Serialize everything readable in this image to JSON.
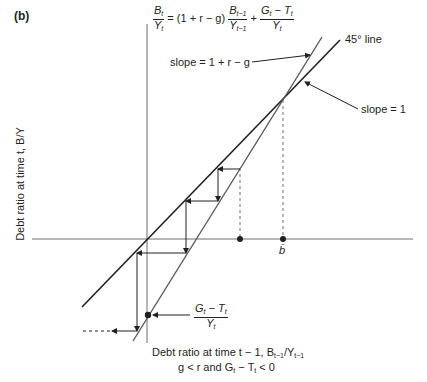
{
  "figure": {
    "panel_label": "(b)",
    "equation": {
      "lhs_num": "B",
      "lhs_num_sub": "t",
      "lhs_den": "Y",
      "lhs_den_sub": "t",
      "factor": "= (1 + r − g)",
      "mid_num": "B",
      "mid_num_sub": "t−1",
      "mid_den": "Y",
      "mid_den_sub": "t−1",
      "plus": "+",
      "rhs_num": "G",
      "rhs_num_sub": "t",
      "rhs_num_minus": " − T",
      "rhs_num_sub2": "t",
      "rhs_den": "Y",
      "rhs_den_sub": "t"
    },
    "line_labels": {
      "forty_five": "45° line",
      "steep_slope": "slope = 1 + r − g",
      "unit_slope": "slope = 1"
    },
    "steady_state_label": "b̄",
    "intercept_label": {
      "num": "G",
      "num_sub": "t",
      "num_minus": " − T",
      "num_sub2": "t",
      "den": "Y",
      "den_sub": "t"
    },
    "y_axis_label": "Debt ratio at time t, B/Y",
    "x_axis_label": "Debt ratio at time t − 1, B",
    "x_axis_label_tail": "/Y",
    "condition": "g < r and G",
    "condition_tail": " − T",
    "condition_end": " < 0",
    "colors": {
      "ink": "#231f20",
      "axis": "#6d6e71"
    }
  }
}
